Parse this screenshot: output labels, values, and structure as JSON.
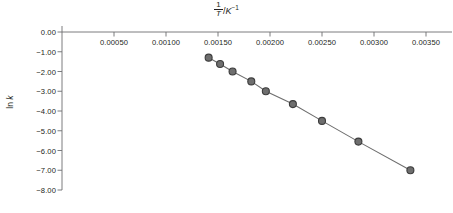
{
  "chart_data": {
    "type": "scatter",
    "title_parts": {
      "numerator": "1",
      "denominator": "T",
      "unit_slash": "/",
      "unit_symbol": "K",
      "unit_exponent": "−1"
    },
    "xlabel": "1/T / K⁻¹",
    "ylabel": "ln k",
    "ylabel_parts": {
      "prefix": "ln ",
      "variable": "k"
    },
    "xlim": [
      0.0,
      0.00375
    ],
    "ylim": [
      -8.0,
      0.0
    ],
    "x_ticks": [
      0.0005,
      0.001,
      0.0015,
      0.002,
      0.0025,
      0.003,
      0.0035
    ],
    "x_tick_labels": [
      "0.00050",
      "0.00100",
      "0.00150",
      "0.00200",
      "0.00250",
      "0.00300",
      "0.00350"
    ],
    "y_ticks": [
      0.0,
      -1.0,
      -2.0,
      -3.0,
      -4.0,
      -5.0,
      -6.0,
      -7.0,
      -8.0
    ],
    "y_tick_labels": [
      "0.00",
      "−1.00",
      "−2.00",
      "−3.00",
      "−4.00",
      "−5.00",
      "−6.00",
      "−7.00",
      "−8.00"
    ],
    "grid": false,
    "legend": null,
    "connected": true,
    "marker": "circle",
    "marker_size": 7,
    "x": [
      0.00141,
      0.00152,
      0.00164,
      0.00182,
      0.00196,
      0.00222,
      0.0025,
      0.00285,
      0.00335
    ],
    "y": [
      -1.3,
      -1.62,
      -2.0,
      -2.5,
      -3.0,
      -3.65,
      -4.5,
      -5.55,
      -7.0
    ],
    "points": [
      {
        "x": 0.00141,
        "y": -1.3
      },
      {
        "x": 0.00152,
        "y": -1.62
      },
      {
        "x": 0.00164,
        "y": -2.0
      },
      {
        "x": 0.00182,
        "y": -2.5
      },
      {
        "x": 0.00196,
        "y": -3.0
      },
      {
        "x": 0.00222,
        "y": -3.65
      },
      {
        "x": 0.0025,
        "y": -4.5
      },
      {
        "x": 0.00285,
        "y": -5.55
      },
      {
        "x": 0.00335,
        "y": -7.0
      }
    ]
  },
  "style": {
    "marker_fill": "#6e6e6e",
    "marker_stroke": "#3c3c3c",
    "line_color": "#6e6e6e",
    "axis_color": "#6d6e71",
    "text_color": "#231f20",
    "background": "#ffffff"
  },
  "geometry": {
    "x_axis_y": 32,
    "y_axis_x": 62,
    "x_left_value": 0.0,
    "px_per_x_unit": 104000,
    "y_top": 32,
    "px_per_y_unit": 19.75
  }
}
